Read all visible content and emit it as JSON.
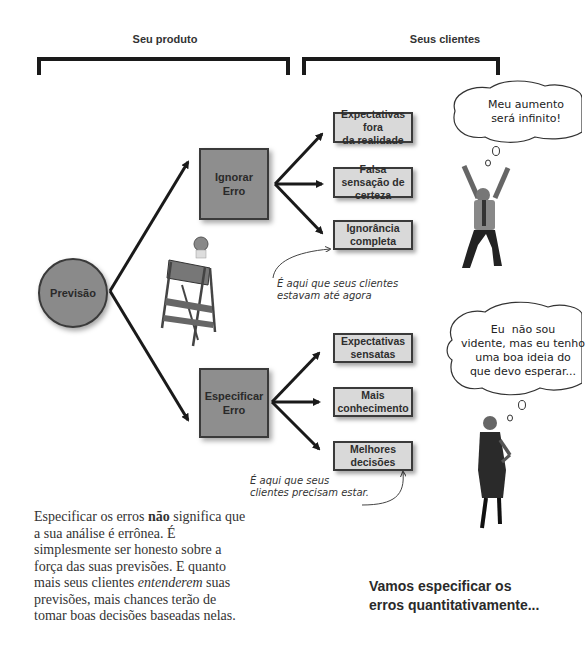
{
  "header": {
    "product_label": "Seu produto",
    "clients_label": "Seus clientes"
  },
  "diagram": {
    "root": {
      "label": "Previsão",
      "icon": "forecast-circle"
    },
    "branches": [
      {
        "label": "Ignorar\nErro",
        "label_lines": [
          "Ignorar",
          "Erro"
        ],
        "outcomes": [
          "Expectativas fora\nda realidade",
          "Falsa sensação de\ncerteza",
          "Ignorância\ncompleta"
        ],
        "annotation": "É aqui que seus clientes\nestavam até agora",
        "thought_bubble": "Meu aumento\nserá infinito!",
        "person": "excited-man-figure"
      },
      {
        "label": "Especificar\nErro",
        "label_lines": [
          "Especificar",
          "Erro"
        ],
        "outcomes": [
          "Expectativas\nsensatas",
          "Mais\nconhecimento",
          "Melhores\ndecisões"
        ],
        "annotation": "É aqui que seus\nclientes precisam estar.",
        "thought_bubble": "Eu  não sou\nvidente, mas eu tenho\numa boa ideia do\nque devo esperar...",
        "person": "calm-woman-figure"
      }
    ],
    "warning_sign": {
      "label": "PERIGO",
      "icon": "danger-barricade-icon"
    }
  },
  "body_text": {
    "part1": "Especificar os erros ",
    "bold": "não",
    "part2": " significa que a sua análise é errônea. É simplesmente ser honesto sobre a força das suas previsões. E quanto mais seus clientes ",
    "italic": "entenderem",
    "part3": " suas previsões, mais chances terão de tomar boas decisões baseadas nelas."
  },
  "call_to_action": "Vamos especificar os\nerros quantitativamente...",
  "colors": {
    "big_box_fill": "#8e8e8e",
    "small_box_fill": "#d9d9d9",
    "stroke": "#1a1a1a"
  }
}
